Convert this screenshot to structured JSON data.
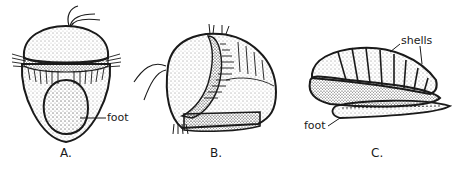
{
  "diagram": {
    "figures": [
      {
        "id": "A",
        "caption": "A.",
        "labels": [
          {
            "text": "foot",
            "target": "foot"
          }
        ]
      },
      {
        "id": "B",
        "caption": "B.",
        "labels": []
      },
      {
        "id": "C",
        "caption": "C.",
        "labels": [
          {
            "text": "shells",
            "target": "shells"
          },
          {
            "text": "foot",
            "target": "foot"
          }
        ]
      }
    ],
    "colors": {
      "ink": "#1a1a1a",
      "background": "#ffffff"
    }
  }
}
